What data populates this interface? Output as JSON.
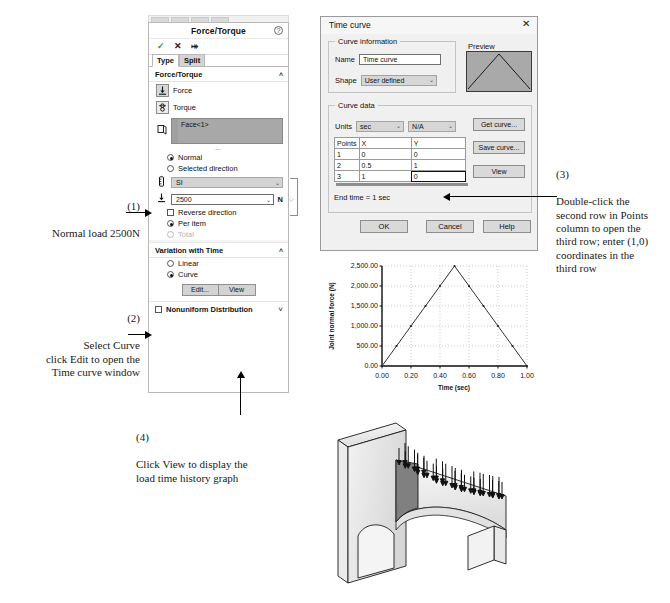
{
  "property_manager": {
    "title": "Force/Torque",
    "help_icon": "question-mark-icon",
    "actions": {
      "ok": "✓",
      "cancel": "✕",
      "pin": "⤅"
    },
    "tabs": [
      {
        "label": "Type",
        "active": true
      },
      {
        "label": "Split",
        "active": false
      }
    ],
    "force_torque_section": {
      "header": "Force/Torque",
      "chevron": "˄",
      "force_button": {
        "label": "Force",
        "icon": "force-arrow-icon",
        "selected": true
      },
      "torque_button": {
        "label": "Torque",
        "icon": "torque-icon",
        "selected": false
      },
      "selection": {
        "icon": "face-selection-icon",
        "value": "Face<1>"
      },
      "direction_options": [
        {
          "label": "Normal",
          "selected": true
        },
        {
          "label": "Selected direction",
          "selected": false
        }
      ],
      "unit_system": {
        "icon": "units-icon",
        "value": "SI",
        "caret": "⌄"
      },
      "force_value": {
        "icon": "force-arrow-icon",
        "value": "2500",
        "caret": "⌄",
        "unit": "N"
      },
      "reverse_direction": {
        "label": "Reverse direction",
        "checked": false
      },
      "per_item": {
        "label": "Per item",
        "selected": true
      },
      "total": {
        "label": "Total",
        "selected": false,
        "disabled": true
      }
    },
    "variation_section": {
      "header": "Variation with Time",
      "chevron": "˄",
      "options": [
        {
          "label": "Linear",
          "selected": false
        },
        {
          "label": "Curve",
          "selected": true
        }
      ],
      "buttons": [
        {
          "label": "Edit..."
        },
        {
          "label": "View"
        }
      ]
    },
    "nonuniform_distribution": {
      "label": "Nonuniform Distribution",
      "checked": false,
      "chevron": "˅"
    }
  },
  "time_curve_dialog": {
    "title": "Time curve",
    "close_icon": "close-x-icon",
    "curve_information": {
      "group_label": "Curve information",
      "name_label": "Name",
      "name_value": "Time curve",
      "shape_label": "Shape",
      "shape_value": "User defined",
      "shape_caret": "⌄"
    },
    "preview": {
      "label": "Preview",
      "description": "triangular-curve-preview"
    },
    "curve_data": {
      "group_label": "Curve data",
      "units_label": "Units",
      "x_units": "sec",
      "y_units": "N/A",
      "caret": "⌄",
      "columns": [
        "Points",
        "X",
        "Y"
      ],
      "rows": [
        {
          "point": "1",
          "x": "0",
          "y": "0"
        },
        {
          "point": "2",
          "x": "0.5",
          "y": "1"
        },
        {
          "point": "3",
          "x": "1",
          "y": "0",
          "active": true
        }
      ],
      "end_time": "End time = 1 sec",
      "side_buttons": [
        {
          "label": "Get curve..."
        },
        {
          "label": "Save curve..."
        },
        {
          "label": "View"
        }
      ]
    },
    "footer_buttons": [
      {
        "label": "OK"
      },
      {
        "label": "Cancel"
      },
      {
        "label": "Help"
      }
    ]
  },
  "chart_data": {
    "type": "line",
    "title": "",
    "xlabel": "Time (sec)",
    "ylabel": "Joint normal force (N)",
    "xlim": [
      0.0,
      1.0
    ],
    "ylim": [
      0.0,
      2500.0
    ],
    "xticks": [
      "0.00",
      "0.20",
      "0.40",
      "0.60",
      "0.80",
      "1.00"
    ],
    "xtick_values": [
      0.0,
      0.2,
      0.4,
      0.6,
      0.8,
      1.0
    ],
    "yticks": [
      "0.00",
      "500.00",
      "1,000.00",
      "1,500.00",
      "2,000.00",
      "2,500.00"
    ],
    "ytick_values": [
      0,
      500,
      1000,
      1500,
      2000,
      2500
    ],
    "grid": true,
    "legend": null,
    "x": [
      0.0,
      0.1,
      0.2,
      0.3,
      0.4,
      0.5,
      0.6,
      0.7,
      0.8,
      0.9,
      1.0
    ],
    "values": [
      0,
      500,
      1000,
      1500,
      2000,
      2500,
      2000,
      1500,
      1000,
      500,
      0
    ]
  },
  "annotations": {
    "a1": {
      "number": "(1)",
      "text": "Normal load 2500N"
    },
    "a2": {
      "number": "(2)",
      "text": "Select Curve\nclick Edit to open the\nTime curve window"
    },
    "a3": {
      "number": "(3)",
      "text": "Double-click the\nsecond row in Points\ncolumn to open the\nthird row; enter (1,0)\ncoordinates in the\nthird row"
    },
    "a4": {
      "number": "(4)",
      "text": "Click View to display the\nload time history graph"
    }
  },
  "model": {
    "description": "3d-arch-bracket-with-load-arrows",
    "load_arrow_count": 34
  }
}
